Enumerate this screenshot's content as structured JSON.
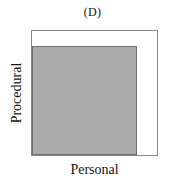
{
  "figure": {
    "panel_title": "(D)",
    "background_color": "#ffffff"
  },
  "axes": {
    "x_label": "Personal",
    "y_label": "Procedural",
    "frame_color": "#8a8a8a",
    "frame_fill": "#ffffff"
  },
  "chart_data": {
    "type": "area",
    "title": "(D)",
    "xlabel": "Personal",
    "ylabel": "Procedural",
    "xlim": [
      0,
      1
    ],
    "ylim": [
      0,
      1
    ],
    "grid": false,
    "legend": null,
    "tick_labels": {
      "x": [],
      "y": []
    },
    "regions": [
      {
        "name": "shaded-region",
        "label": "",
        "fill_color": "#aaaaaa",
        "edge_color": "#6f6f6f",
        "x_start": 0.0,
        "x_end": 0.84,
        "y_start": 0.0,
        "y_end": 0.88
      }
    ]
  }
}
